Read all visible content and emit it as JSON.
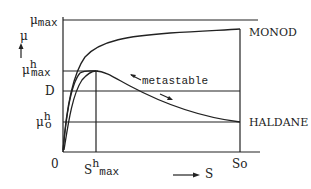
{
  "diagram": {
    "y_axis": {
      "symbol": "μ",
      "labels": {
        "mu_max": {
          "main": "μ",
          "sub": "max"
        },
        "mu_h_max": {
          "main": "μ",
          "sup": "h",
          "sub": "max"
        },
        "D": "D",
        "mu_h_o": {
          "main": "μ",
          "sup": "h",
          "sub": "o"
        }
      }
    },
    "x_axis": {
      "symbol": "S",
      "labels": {
        "origin": "0",
        "s_h_max": {
          "main": "S",
          "sup": "h",
          "sub": "max"
        },
        "So": "So"
      }
    },
    "curves": {
      "monod": "MONOD",
      "haldane": "HALDANE"
    },
    "annotation": "metastable",
    "colors": {
      "ink": "#222222",
      "background": "#ffffff"
    }
  }
}
